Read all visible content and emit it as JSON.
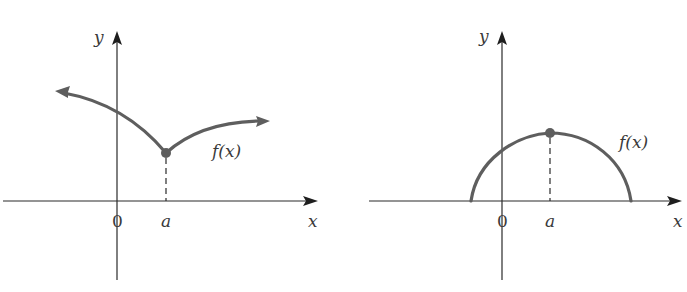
{
  "figures": [
    {
      "id": "left",
      "description": "Cusp: f has a local minimum at x=a with a sharp corner",
      "labels": {
        "y_axis": "y",
        "x_axis": "x",
        "origin": "0",
        "a": "a",
        "function": "f(x)"
      }
    },
    {
      "id": "right",
      "description": "Arc: f has a local maximum at x=a with a horizontal tangent",
      "labels": {
        "y_axis": "y",
        "x_axis": "x",
        "origin": "0",
        "a": "a",
        "function": "f(x)"
      }
    }
  ],
  "colors": {
    "curve": "#5e5e5e",
    "axis": "#2a2a2a",
    "text": "#3a3a3a"
  }
}
